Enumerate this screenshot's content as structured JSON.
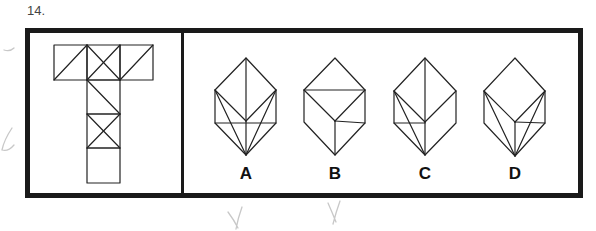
{
  "question": {
    "number_label": "14."
  },
  "net": {
    "description": "T-shaped cube net with diagonal markings",
    "squares": [
      {
        "x": 54,
        "y": 45,
        "lines": [
          [
            54,
            80,
            87,
            45
          ]
        ]
      },
      {
        "x": 87,
        "y": 45,
        "lines": [
          [
            87,
            45,
            120,
            80
          ],
          [
            87,
            80,
            120,
            45
          ]
        ]
      },
      {
        "x": 120,
        "y": 45,
        "lines": [
          [
            120,
            80,
            153,
            45
          ]
        ]
      },
      {
        "x": 87,
        "y": 80,
        "lines": [
          [
            87,
            80,
            120,
            114
          ]
        ]
      },
      {
        "x": 87,
        "y": 114,
        "lines": [
          [
            87,
            114,
            120,
            148
          ],
          [
            87,
            148,
            120,
            114
          ]
        ]
      },
      {
        "x": 87,
        "y": 148,
        "lines": []
      }
    ],
    "size": 33
  },
  "options": [
    {
      "label": "A",
      "label_x": 231
    },
    {
      "label": "B",
      "label_x": 320
    },
    {
      "label": "C",
      "label_x": 410
    },
    {
      "label": "D",
      "label_x": 500
    }
  ],
  "colors": {
    "frame": "#1a1a1a",
    "line": "#222222",
    "pencil": "#c8c8c8"
  }
}
